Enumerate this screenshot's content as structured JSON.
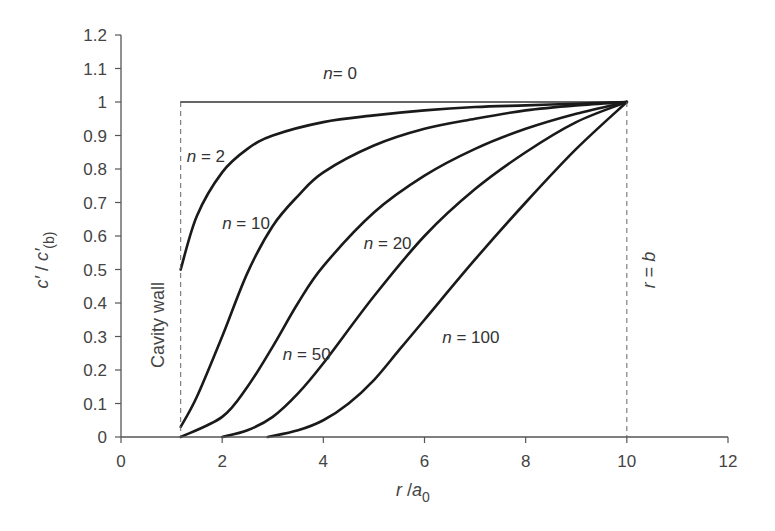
{
  "chart_data": {
    "type": "line",
    "title": "",
    "xlabel": "r / a0",
    "xlabel_parts": {
      "var": "r",
      "sep": " /",
      "base": "a",
      "sub": "0"
    },
    "ylabel": "c' / c'(b)",
    "ylabel_parts": {
      "num": "c′",
      "sep": " / ",
      "den": "c′",
      "sub": "(b)"
    },
    "xlim": [
      0,
      12
    ],
    "ylim": [
      0,
      1.2
    ],
    "xticks": [
      "0",
      "2",
      "4",
      "6",
      "8",
      "10",
      "12"
    ],
    "yticks": [
      "0",
      "0.1",
      "0.2",
      "0.3",
      "0.4",
      "0.5",
      "0.6",
      "0.7",
      "0.8",
      "0.9",
      "1",
      "1.1",
      "1.2"
    ],
    "grid": false,
    "legend": "none (inline labels)",
    "series": [
      {
        "name": "n = 0",
        "x": [
          1.18,
          10
        ],
        "y": [
          1.0,
          1.0
        ]
      },
      {
        "name": "n = 2",
        "x": [
          1.18,
          1.5,
          2.0,
          2.5,
          3.0,
          4.0,
          5.0,
          6.0,
          7.0,
          8.0,
          9.0,
          10.0
        ],
        "y": [
          0.5,
          0.66,
          0.79,
          0.86,
          0.9,
          0.94,
          0.96,
          0.975,
          0.985,
          0.99,
          0.995,
          1.0
        ]
      },
      {
        "name": "n = 10",
        "x": [
          1.18,
          1.5,
          2.0,
          2.5,
          3.0,
          3.5,
          4.0,
          5.0,
          6.0,
          7.0,
          8.0,
          9.0,
          10.0
        ],
        "y": [
          0.03,
          0.12,
          0.3,
          0.49,
          0.63,
          0.72,
          0.79,
          0.87,
          0.92,
          0.95,
          0.975,
          0.99,
          1.0
        ]
      },
      {
        "name": "n = 20",
        "x": [
          1.18,
          2.0,
          2.5,
          3.0,
          3.5,
          4.0,
          5.0,
          6.0,
          7.0,
          8.0,
          9.0,
          10.0
        ],
        "y": [
          0.0,
          0.06,
          0.15,
          0.27,
          0.4,
          0.51,
          0.67,
          0.78,
          0.86,
          0.92,
          0.965,
          1.0
        ]
      },
      {
        "name": "n = 50",
        "x": [
          2.0,
          2.5,
          3.0,
          3.5,
          4.0,
          5.0,
          6.0,
          7.0,
          8.0,
          9.0,
          10.0
        ],
        "y": [
          0.0,
          0.02,
          0.06,
          0.13,
          0.22,
          0.42,
          0.6,
          0.74,
          0.85,
          0.94,
          1.0
        ]
      },
      {
        "name": "n = 100",
        "x": [
          2.9,
          3.5,
          4.0,
          4.5,
          5.0,
          5.5,
          6.0,
          7.0,
          8.0,
          9.0,
          10.0
        ],
        "y": [
          0.0,
          0.02,
          0.05,
          0.1,
          0.17,
          0.26,
          0.35,
          0.53,
          0.7,
          0.86,
          1.0
        ]
      }
    ],
    "reference_lines": [
      {
        "orientation": "vertical",
        "x": 1.18,
        "style": "dashed",
        "label": "Cavity wall"
      },
      {
        "orientation": "vertical",
        "x": 10,
        "style": "dashed",
        "label": "r = b"
      }
    ],
    "annotations": [
      {
        "text_var": "n",
        "text_rest": "= 0",
        "x": 4.0,
        "y": 1.07
      },
      {
        "text_var": "n",
        "text_rest": " = 2",
        "x": 1.3,
        "y": 0.82
      },
      {
        "text_var": "n",
        "text_rest": " = 10",
        "x": 2.0,
        "y": 0.62
      },
      {
        "text_var": "n",
        "text_rest": " = 20",
        "x": 4.8,
        "y": 0.56
      },
      {
        "text_var": "n",
        "text_rest": " = 50",
        "x": 3.2,
        "y": 0.23
      },
      {
        "text_var": "n",
        "text_rest": " = 100",
        "x": 6.35,
        "y": 0.28
      }
    ],
    "wall_label": "Cavity wall",
    "boundary_label": {
      "var1": "r",
      "eq": " = ",
      "var2": "b"
    }
  },
  "colors": {
    "curve": "#1a1a1a",
    "axis": "#555555",
    "text": "#444444"
  }
}
